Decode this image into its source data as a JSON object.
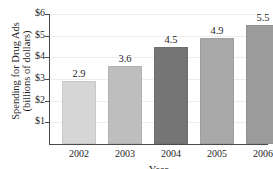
{
  "chart_data": {
    "type": "bar",
    "title": "",
    "xlabel": "Year",
    "ylabel_line1": "Spending for Drug Ads",
    "ylabel_line2": "(billions of dollars)",
    "categories": [
      "2002",
      "2003",
      "2004",
      "2005",
      "2006"
    ],
    "values": [
      2.9,
      3.6,
      4.5,
      4.9,
      5.5
    ],
    "value_labels": [
      "2.9",
      "3.6",
      "4.5",
      "4.9",
      "5.5"
    ],
    "ytick_labels": [
      "$6",
      "$5",
      "$4",
      "$3",
      "$2",
      "$1"
    ],
    "ytick_values": [
      6,
      5,
      4,
      3,
      2,
      1
    ],
    "ylim": [
      0,
      6
    ],
    "grid": true,
    "legend": "none",
    "bar_colors": [
      "#d6d6d6",
      "#bebebe",
      "#757575",
      "#a9a9a9",
      "#9b9b9b"
    ],
    "axis_color": "#4a4a4a",
    "grid_color": "#ededed",
    "background": "#ffffff"
  }
}
